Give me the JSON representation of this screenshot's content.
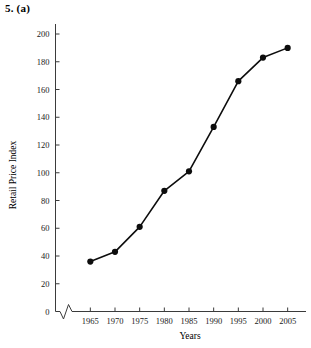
{
  "figure": {
    "label": "5.  (a)"
  },
  "chart_data": {
    "type": "line",
    "title": "",
    "xlabel": "Years",
    "ylabel": "Retail Price Index",
    "x": [
      1965,
      1970,
      1975,
      1980,
      1985,
      1990,
      1995,
      2000,
      2005
    ],
    "values": [
      36,
      43,
      61,
      87,
      101,
      133,
      166,
      183,
      190
    ],
    "categories": [
      "1965",
      "1970",
      "1975",
      "1980",
      "1985",
      "1990",
      "1995",
      "2000",
      "2005"
    ],
    "xlim": [
      1962.5,
      2007.5
    ],
    "ylim": [
      0,
      200
    ],
    "x_tick_labels": [
      "1965",
      "1970",
      "1975",
      "1980",
      "1985",
      "1990",
      "1995",
      "2000",
      "2005"
    ],
    "y_tick_labels": [
      "0",
      "20",
      "40",
      "60",
      "80",
      "100",
      "120",
      "140",
      "160",
      "180",
      "200"
    ],
    "y_ticks": [
      0,
      20,
      40,
      60,
      80,
      100,
      120,
      140,
      160,
      180,
      200
    ],
    "grid": false,
    "legend": false,
    "legend_position": "none",
    "axis_break": {
      "axis": "x",
      "description": "zigzag break between origin and first tick"
    },
    "marker": "filled-circle",
    "line_color": "#0d0d0d",
    "marker_color": "#0d0d0d",
    "axis_color": "#3b3b3b"
  }
}
